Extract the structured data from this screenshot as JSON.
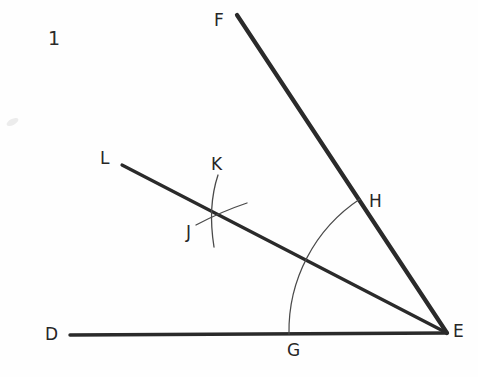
{
  "figure": {
    "number_label": "1",
    "background_color": "#fefefe",
    "ink_color": "#2a2a2a",
    "arc_color": "#4a4a4a",
    "smudge_color": "#ececec",
    "width": 478,
    "height": 377
  },
  "points": [
    {
      "id": "D",
      "label": "D",
      "x": 70,
      "y": 335,
      "label_x": 45,
      "label_y": 326
    },
    {
      "id": "E",
      "label": "E",
      "x": 447,
      "y": 333,
      "label_x": 453,
      "label_y": 323
    },
    {
      "id": "F",
      "label": "F",
      "x": 237,
      "y": 15,
      "label_x": 214,
      "label_y": 12
    },
    {
      "id": "G",
      "label": "G",
      "x": 290,
      "y": 334,
      "label_x": 287,
      "label_y": 342
    },
    {
      "id": "H",
      "label": "H",
      "x": 361,
      "y": 199,
      "label_x": 369,
      "label_y": 193
    },
    {
      "id": "J",
      "label": "J",
      "x": 206,
      "y": 215,
      "label_x": 186,
      "label_y": 224
    },
    {
      "id": "K",
      "label": "K",
      "x": 216,
      "y": 188,
      "label_x": 211,
      "label_y": 156
    },
    {
      "id": "L",
      "label": "L",
      "x": 122,
      "y": 165,
      "label_x": 100,
      "label_y": 150
    }
  ],
  "segments": [
    {
      "name": "ray-ED",
      "from": "E",
      "to": "D",
      "x1": 447,
      "y1": 333,
      "x2": 70,
      "y2": 335,
      "stroke_width": 3.4
    },
    {
      "name": "ray-EF",
      "from": "E",
      "to": "F",
      "x1": 447,
      "y1": 333,
      "x2": 237,
      "y2": 15,
      "stroke_width": 4.2
    },
    {
      "name": "ray-EL",
      "from": "E",
      "to": "L",
      "x1": 447,
      "y1": 333,
      "x2": 122,
      "y2": 165,
      "stroke_width": 3.2
    }
  ],
  "arcs": [
    {
      "name": "main-arc-GH",
      "center": "E",
      "cx": 447,
      "cy": 333,
      "radius": 158,
      "from_point": "G",
      "to_point": "H",
      "path": "M 289 334 A 158 158 0 0 1 360 199",
      "stroke_width": 1.2
    },
    {
      "name": "compass-arc-from-G",
      "path": "M 218 175 C 211 196, 210 222, 214 247",
      "stroke_width": 1.3
    },
    {
      "name": "compass-arc-from-H",
      "path": "M 196 225 C 213 216, 232 208, 247 203",
      "stroke_width": 1.3
    }
  ],
  "smudge": {
    "name": "paper-smudge",
    "x": 6,
    "y": 119
  }
}
